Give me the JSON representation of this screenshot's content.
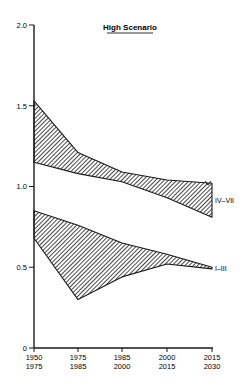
{
  "chart_data": {
    "type": "area",
    "title": "High Scenario",
    "xlabel": "",
    "ylabel": "",
    "ylim": [
      0,
      2.0
    ],
    "yticks": [
      "0",
      "0.5",
      "1.0",
      "1.5",
      "2.0"
    ],
    "ytick_values": [
      0,
      0.5,
      1.0,
      1.5,
      2.0
    ],
    "categories": [
      "1950–1975",
      "1975–1985",
      "1985–2000",
      "2000–2015",
      "2015–2030"
    ],
    "xtick_labels": [
      {
        "line1": "1950",
        "line2": "1975"
      },
      {
        "line1": "1975",
        "line2": "1985"
      },
      {
        "line1": "1985",
        "line2": "2000"
      },
      {
        "line1": "2000",
        "line2": "2015"
      },
      {
        "line1": "2015",
        "line2": "2030"
      }
    ],
    "grid": false,
    "fill_pattern": "diagonal-hatch",
    "series": [
      {
        "name": "IV–VII",
        "role": "band",
        "upper": [
          1.53,
          1.21,
          1.09,
          1.04,
          1.02
        ],
        "lower": [
          1.15,
          1.08,
          1.03,
          0.93,
          0.81
        ]
      },
      {
        "name": "I–III",
        "role": "band",
        "upper": [
          0.85,
          0.76,
          0.65,
          0.58,
          0.5
        ],
        "lower": [
          0.68,
          0.3,
          0.44,
          0.52,
          0.49
        ]
      }
    ]
  },
  "colors": {
    "ink": "#1a1a1a",
    "background": "#ffffff"
  }
}
